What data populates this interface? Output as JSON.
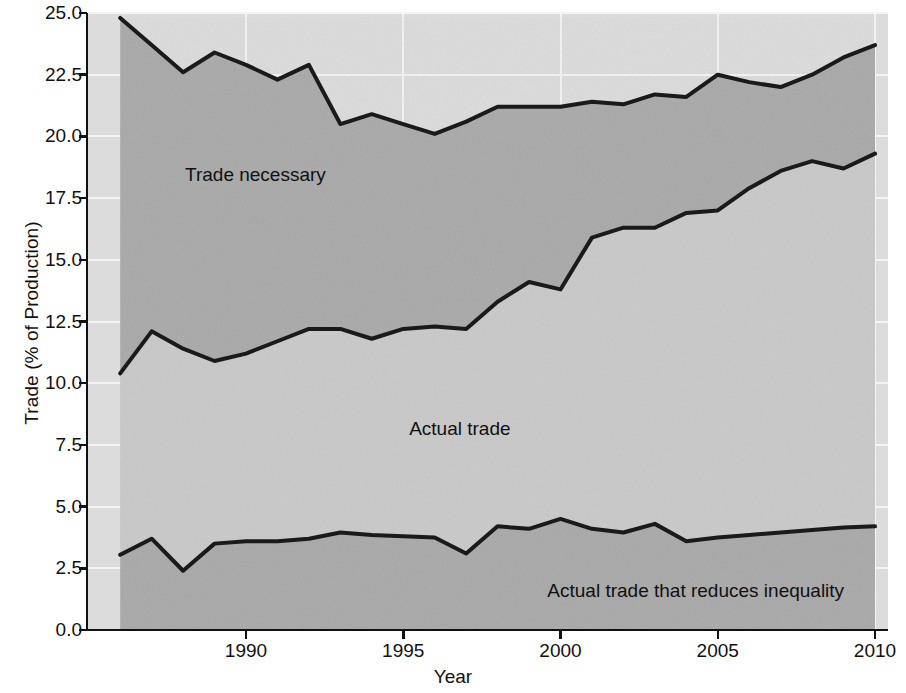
{
  "chart_data": {
    "type": "area",
    "title": "",
    "xlabel": "Year",
    "ylabel": "Trade (% of Production)",
    "xlim": [
      1986,
      2010
    ],
    "ylim": [
      0.0,
      25.0
    ],
    "grid": true,
    "legend_position": "inline-annotations",
    "x": [
      1986,
      1987,
      1988,
      1989,
      1990,
      1991,
      1992,
      1993,
      1994,
      1995,
      1996,
      1997,
      1998,
      1999,
      2000,
      2001,
      2002,
      2003,
      2004,
      2005,
      2006,
      2007,
      2008,
      2009,
      2010
    ],
    "xticks": [
      1990,
      1995,
      2000,
      2005,
      2010
    ],
    "xtick_labels": [
      "1990",
      "1995",
      "2000",
      "2005",
      "2010"
    ],
    "yticks": [
      0.0,
      2.5,
      5.0,
      7.5,
      10.0,
      12.5,
      15.0,
      17.5,
      20.0,
      22.5,
      25.0
    ],
    "ytick_labels": [
      "0.0",
      "2.5",
      "5.0",
      "7.5",
      "10.0",
      "12.5",
      "15.0",
      "17.5",
      "20.0",
      "22.5",
      "25.0"
    ],
    "series": [
      {
        "name": "Trade necessary",
        "band": "upper",
        "fill_hex": "#a8a8a8",
        "line_hex": "#1a1a1a",
        "values": [
          24.8,
          23.7,
          22.6,
          23.4,
          22.9,
          22.3,
          22.9,
          20.5,
          20.9,
          20.5,
          20.1,
          20.6,
          21.2,
          21.2,
          21.2,
          21.4,
          21.3,
          21.7,
          21.6,
          22.5,
          22.2,
          22.0,
          22.5,
          23.2,
          23.7
        ]
      },
      {
        "name": "Actual trade",
        "band": "middle",
        "fill_hex": "#c9c9c9",
        "line_hex": "#1a1a1a",
        "values": [
          10.4,
          12.1,
          11.4,
          10.9,
          11.2,
          11.7,
          12.2,
          12.2,
          11.8,
          12.2,
          12.3,
          12.2,
          13.3,
          14.1,
          13.8,
          15.9,
          16.3,
          16.3,
          16.9,
          17.0,
          17.9,
          18.6,
          19.0,
          18.7,
          19.3
        ]
      },
      {
        "name": "Actual trade that reduces inequality",
        "band": "lower",
        "fill_hex": "#a8a8a8",
        "line_hex": "#1a1a1a",
        "values": [
          3.05,
          3.7,
          2.4,
          3.5,
          3.6,
          3.6,
          3.7,
          3.95,
          3.85,
          3.8,
          3.75,
          3.1,
          4.2,
          4.1,
          4.5,
          4.1,
          3.95,
          4.3,
          3.6,
          3.75,
          3.85,
          3.95,
          4.05,
          4.15,
          4.2
        ]
      }
    ],
    "annotations": [
      {
        "text": "Trade necessary",
        "x": 1990.3,
        "y": 18.2
      },
      {
        "text": "Actual trade",
        "x": 1996.8,
        "y": 7.9
      },
      {
        "text": "Actual trade that reduces inequality",
        "x": 2004.3,
        "y": 1.35
      }
    ],
    "colors": {
      "outer_background": "#e8e8e8",
      "plot_background": "#dcdcdc",
      "band_upper_fill": "#a8a8a8",
      "band_middle_fill": "#c9c9c9",
      "band_lower_fill": "#a8a8a8",
      "line": "#1a1a1a",
      "axis": "#111111",
      "grid": "#f2f2f2",
      "text": "#111111"
    }
  }
}
